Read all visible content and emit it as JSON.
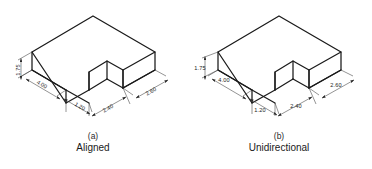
{
  "figure_a": {
    "caption_letter": "(a)",
    "caption_title": "Aligned",
    "dimension_style": "aligned",
    "dimensions": {
      "height": "1.75",
      "width_left": "4.00",
      "notch_front": "1.20",
      "notch_right": "2.40",
      "depth_right": "2.60"
    }
  },
  "figure_b": {
    "caption_letter": "(b)",
    "caption_title": "Unidirectional",
    "dimension_style": "unidirectional",
    "dimensions": {
      "height": "1.75",
      "width_left": "4.00",
      "notch_front": "1.20",
      "notch_right": "2.40",
      "depth_right": "2.60"
    }
  },
  "colors": {
    "background": "#ffffff",
    "object_line": "#1a1a1a",
    "dimension_line": "#3a3a3a",
    "text": "#1a1a1a"
  }
}
